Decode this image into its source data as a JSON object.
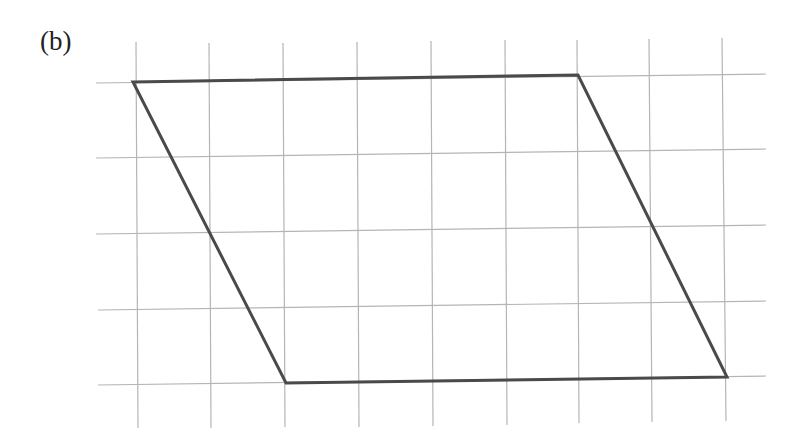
{
  "figure": {
    "label": "(b)",
    "colors": {
      "grid": "#b5b5b5",
      "shape": "#4a4a4a",
      "background": "#ffffff",
      "label": "#222222"
    },
    "grid": {
      "vertical_lines": [
        {
          "x1": 136,
          "y1": 42,
          "x2": 138,
          "y2": 428
        },
        {
          "x1": 209,
          "y1": 43,
          "x2": 211,
          "y2": 428
        },
        {
          "x1": 283,
          "y1": 43,
          "x2": 285,
          "y2": 427
        },
        {
          "x1": 357,
          "y1": 42,
          "x2": 359,
          "y2": 427
        },
        {
          "x1": 431,
          "y1": 41,
          "x2": 433,
          "y2": 426
        },
        {
          "x1": 505,
          "y1": 40,
          "x2": 507,
          "y2": 425
        },
        {
          "x1": 577,
          "y1": 40,
          "x2": 579,
          "y2": 423
        },
        {
          "x1": 649,
          "y1": 39,
          "x2": 652,
          "y2": 422
        },
        {
          "x1": 722,
          "y1": 38,
          "x2": 726,
          "y2": 421
        }
      ],
      "horizontal_lines": [
        {
          "x1": 96,
          "y1": 83,
          "x2": 766,
          "y2": 74
        },
        {
          "x1": 96,
          "y1": 158,
          "x2": 766,
          "y2": 149
        },
        {
          "x1": 96,
          "y1": 234,
          "x2": 766,
          "y2": 225
        },
        {
          "x1": 98,
          "y1": 310,
          "x2": 766,
          "y2": 301
        },
        {
          "x1": 98,
          "y1": 385,
          "x2": 766,
          "y2": 376
        }
      ]
    },
    "parallelogram": {
      "vertices": [
        {
          "x": 133,
          "y": 82
        },
        {
          "x": 578,
          "y": 75
        },
        {
          "x": 727,
          "y": 377
        },
        {
          "x": 286,
          "y": 383
        }
      ]
    }
  }
}
